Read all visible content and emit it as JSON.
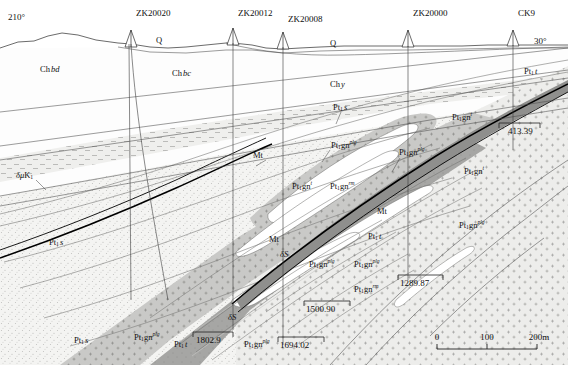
{
  "figure": {
    "bearing_left": "210°",
    "bearing_right": "30°"
  },
  "boreholes": [
    {
      "name": "ZK20020",
      "x": 131,
      "label_x": 136,
      "label_y": 12,
      "top_y": 36,
      "bottom_y": 300
    },
    {
      "name": "ZK20012",
      "x": 233,
      "label_x": 238,
      "label_y": 12,
      "top_y": 30,
      "bottom_y": 330
    },
    {
      "name": "ZK20008",
      "x": 283,
      "label_x": 288,
      "label_y": 18,
      "top_y": 34,
      "bottom_y": 345
    },
    {
      "name": "ZK20000",
      "x": 408,
      "label_x": 413,
      "label_y": 12,
      "top_y": 40,
      "bottom_y": 300
    },
    {
      "name": "CK9",
      "x": 513,
      "label_x": 518,
      "label_y": 12,
      "top_y": 37,
      "bottom_y": 250
    }
  ],
  "units": [
    {
      "id": "Q-left",
      "base": "Q",
      "sub": "",
      "sup": "",
      "x": 156,
      "y": 41,
      "italic": false
    },
    {
      "id": "Q-right",
      "base": "Q",
      "sub": "",
      "sup": "",
      "x": 330,
      "y": 44,
      "italic": false
    },
    {
      "id": "Chbd",
      "base": "Ch",
      "sub": "",
      "sup": "",
      "tail": "bd",
      "x": 40,
      "y": 70,
      "italic": true
    },
    {
      "id": "Chbc",
      "base": "Ch",
      "sub": "",
      "sup": "",
      "tail": "bc",
      "x": 172,
      "y": 74,
      "italic": true
    },
    {
      "id": "Chy",
      "base": "Ch",
      "sub": "",
      "sup": "",
      "tail": "y",
      "x": 330,
      "y": 85,
      "italic": true
    },
    {
      "id": "Pt1t-right",
      "base": "Pt",
      "sub": "1",
      "sup": "",
      "tail": "t",
      "x": 528,
      "y": 72,
      "italic": true
    },
    {
      "id": "Pt1s-mid",
      "base": "Pt",
      "sub": "1",
      "sup": "",
      "tail": "s",
      "x": 337,
      "y": 108,
      "italic": true
    },
    {
      "id": "Pt1gn-t1",
      "base": "Pt",
      "sub": "1",
      "sup": "t",
      "tail": "gn",
      "x": 458,
      "y": 118,
      "italic": false
    },
    {
      "id": "Pt1gn-plg1",
      "base": "Pt",
      "sub": "1",
      "sup": "plg",
      "tail": "gn",
      "x": 337,
      "y": 146,
      "italic": false
    },
    {
      "id": "Pt1gn-plg2",
      "base": "Pt",
      "sub": "1",
      "sup": "plg",
      "tail": "gn",
      "x": 405,
      "y": 153,
      "italic": false
    },
    {
      "id": "Pt1gn-t2",
      "base": "Pt",
      "sub": "1",
      "sup": "t",
      "tail": "gn",
      "x": 470,
      "y": 172,
      "italic": false
    },
    {
      "id": "Pt1gn-t3",
      "base": "Pt",
      "sub": "1",
      "sup": "t",
      "tail": "gn",
      "x": 298,
      "y": 187,
      "italic": false
    },
    {
      "id": "Pt1gn-rm1",
      "base": "Pt",
      "sub": "1",
      "sup": "rm",
      "tail": "gn",
      "x": 336,
      "y": 187,
      "italic": false
    },
    {
      "id": "Pt1gn-plg3",
      "base": "Pt",
      "sub": "1",
      "sup": "plg",
      "tail": "gn",
      "x": 465,
      "y": 226,
      "italic": false
    },
    {
      "id": "Pt1t-mid",
      "base": "Pt",
      "sub": "1",
      "sup": "",
      "tail": "t",
      "x": 372,
      "y": 237,
      "italic": true
    },
    {
      "id": "Pt1gn-plg4",
      "base": "Pt",
      "sub": "1",
      "sup": "plg",
      "tail": "gn",
      "x": 315,
      "y": 265,
      "italic": false
    },
    {
      "id": "Pt1gn-plg5",
      "base": "Pt",
      "sub": "1",
      "sup": "plg",
      "tail": "gn",
      "x": 360,
      "y": 265,
      "italic": false
    },
    {
      "id": "Pt1gn-rm2",
      "base": "Pt",
      "sub": "1",
      "sup": "rm",
      "tail": "gn",
      "x": 360,
      "y": 290,
      "italic": false
    },
    {
      "id": "Pt1s-left",
      "base": "Pt",
      "sub": "1",
      "sup": "",
      "tail": "s",
      "x": 53,
      "y": 243,
      "italic": true
    },
    {
      "id": "Pt1s-bl",
      "base": "Pt",
      "sub": "1",
      "sup": "",
      "tail": "s",
      "x": 78,
      "y": 341,
      "italic": true
    },
    {
      "id": "Pt1gn-plg6",
      "base": "Pt",
      "sub": "1",
      "sup": "plg",
      "tail": "gn",
      "x": 140,
      "y": 338,
      "italic": false
    },
    {
      "id": "Pt1t-bot",
      "base": "Pt",
      "sub": "1",
      "sup": "",
      "tail": "t",
      "x": 178,
      "y": 345,
      "italic": true
    },
    {
      "id": "Pt1gn-plg7",
      "base": "Pt",
      "sub": "1",
      "sup": "plg",
      "tail": "gn",
      "x": 250,
      "y": 345,
      "italic": false
    }
  ],
  "marker_labels": [
    {
      "id": "Mt-1",
      "text": "Mt",
      "x": 259,
      "y": 156
    },
    {
      "id": "Mt-2",
      "text": "Mt",
      "x": 383,
      "y": 212
    },
    {
      "id": "Mt-3",
      "text": "Mt",
      "x": 275,
      "y": 240
    },
    {
      "id": "dS-1",
      "text": "δS",
      "x": 286,
      "y": 255,
      "italic": true
    },
    {
      "id": "dS-2",
      "text": "δS",
      "x": 234,
      "y": 318,
      "italic": true
    },
    {
      "id": "dmuK1",
      "text": "δμK",
      "sub": "1",
      "x": 22,
      "y": 176,
      "italic": true
    }
  ],
  "elevations": [
    {
      "value": "413.39",
      "x": 511,
      "y": 129,
      "tick_x1": 499,
      "tick_x2": 540,
      "tick_y": 123
    },
    {
      "value": "1289.87",
      "x": 408,
      "y": 281,
      "tick_x1": 398,
      "tick_x2": 443,
      "tick_y": 275
    },
    {
      "value": "1500.90",
      "x": 314,
      "y": 307,
      "tick_x1": 304,
      "tick_x2": 350,
      "tick_y": 301
    },
    {
      "value": "1694.02",
      "x": 288,
      "y": 343,
      "tick_x1": 278,
      "tick_x2": 324,
      "tick_y": 337
    },
    {
      "value": "1802.9",
      "x": 202,
      "y": 338,
      "tick_x1": 193,
      "tick_x2": 233,
      "tick_y": 332
    }
  ],
  "scalebar": {
    "ticks": [
      "0",
      "100",
      "200m"
    ],
    "x_start": 437,
    "x_end": 537,
    "y": 345,
    "label_y": 338
  },
  "colors": {
    "ink": "#111111",
    "line": "#4a4a4a",
    "fault": "#000000",
    "fill_light": "#f2f2f0",
    "fill_stipple": "#e8e8e6",
    "fill_grey_mid": "#c4c4c2",
    "fill_grey_dark": "#9a9a98",
    "fill_white": "#ffffff",
    "background": "#ffffff"
  }
}
